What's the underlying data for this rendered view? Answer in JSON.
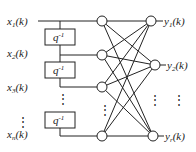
{
  "diagram": {
    "title": "",
    "inputs": [
      {
        "name": "x",
        "sub": "1",
        "arg": "(k)"
      },
      {
        "name": "x",
        "sub": "2",
        "arg": "(k)"
      },
      {
        "name": "x",
        "sub": "3",
        "arg": "(k)"
      },
      {
        "name": "x",
        "sub": "n",
        "arg": "(k)"
      }
    ],
    "outputs": [
      {
        "name": "y",
        "sub": "1",
        "arg": "(k)"
      },
      {
        "name": "y",
        "sub": "2",
        "arg": "(k)"
      },
      {
        "name": "y",
        "sub": "r",
        "arg": "(k)"
      }
    ],
    "delay_blocks": [
      {
        "label": "q",
        "exp": "-1"
      },
      {
        "label": "q",
        "exp": "-1"
      },
      {
        "label": "q",
        "exp": "-1"
      }
    ],
    "ellipsis": "⋮",
    "line_color": "#222222"
  }
}
